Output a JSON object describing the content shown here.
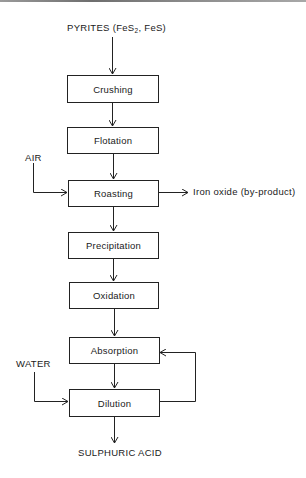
{
  "diagram": {
    "input": {
      "prefix": "PYRITES (FeS",
      "subscript": "2",
      "suffix": ", FeS)"
    },
    "steps": [
      {
        "id": "crushing",
        "label": "Crushing"
      },
      {
        "id": "flotation",
        "label": "Flotation"
      },
      {
        "id": "roasting",
        "label": "Roasting"
      },
      {
        "id": "precipitation",
        "label": "Precipitation"
      },
      {
        "id": "oxidation",
        "label": "Oxidation"
      },
      {
        "id": "absorption",
        "label": "Absorption"
      },
      {
        "id": "dilution",
        "label": "Dilution"
      }
    ],
    "side_inputs": [
      {
        "label": "AIR",
        "target": "roasting"
      },
      {
        "label": "WATER",
        "target": "dilution"
      }
    ],
    "side_outputs": [
      {
        "label": "Iron oxide (by-product)",
        "source": "roasting"
      }
    ],
    "recycle": {
      "from": "dilution",
      "to": "absorption"
    },
    "output": {
      "label": "SULPHURIC ACID"
    },
    "colors": {
      "line": "#222222",
      "background": "#ffffff",
      "text": "#1a1a1a"
    }
  }
}
